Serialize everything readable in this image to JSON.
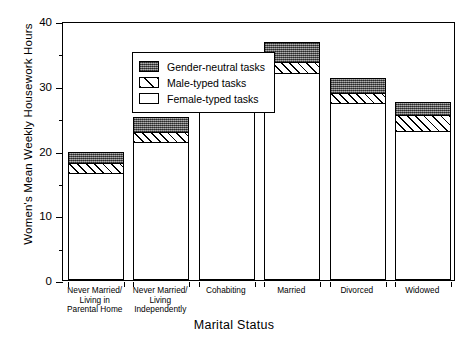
{
  "chart_data": {
    "type": "bar",
    "subtype": "stacked",
    "title": "",
    "xlabel": "Marital Status",
    "ylabel": "Women's Mean Weekly Housework Hours",
    "ylim": [
      0,
      40
    ],
    "ytick_major": [
      0,
      10,
      20,
      30,
      40
    ],
    "ytick_major_labels": [
      "0",
      "10",
      "20",
      "30",
      "40"
    ],
    "ytick_minor": [
      5,
      15,
      25,
      35
    ],
    "grid": false,
    "legend_position": "upper-left-inside",
    "categories": [
      "Never Married/\nLiving in\nParental Home",
      "Never Married/\nLiving\nIndependently",
      "Cohabiting",
      "Married",
      "Divorced",
      "Widowed"
    ],
    "series": [
      {
        "name": "Female-typed tasks",
        "key": "female",
        "values": [
          16.3,
          21.2,
          27.2,
          31.8,
          27.2,
          22.9
        ]
      },
      {
        "name": "Male-typed tasks",
        "key": "male",
        "values": [
          1.6,
          1.5,
          1.5,
          1.7,
          1.5,
          2.4
        ]
      },
      {
        "name": "Gender-neutral tasks",
        "key": "neutral",
        "values": [
          1.6,
          2.3,
          2.3,
          3.1,
          2.3,
          2.0
        ]
      }
    ],
    "totals": [
      19.5,
      25.0,
      31.0,
      36.6,
      31.0,
      27.3
    ],
    "stack_order_bottom_to_top": [
      "female",
      "male",
      "neutral"
    ]
  },
  "legend": {
    "items": [
      {
        "label": "Gender-neutral tasks",
        "key": "neutral"
      },
      {
        "label": "Male-typed tasks",
        "key": "male"
      },
      {
        "label": "Female-typed tasks",
        "key": "female"
      }
    ]
  },
  "colors": {
    "neutral": "#676767",
    "male": "#ffffff",
    "female": "#ffffff",
    "axis": "#000000",
    "background": "#ffffff"
  }
}
